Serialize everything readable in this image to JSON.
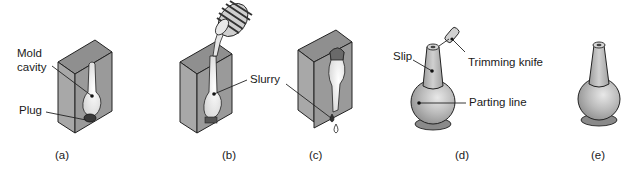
{
  "figure": {
    "colors": {
      "mold_face": "#9a9a9a",
      "mold_side": "#b3b3b3",
      "mold_top": "#8c8c8c",
      "cavity": "#e6e6e6",
      "outline": "#222222",
      "product": "#b8b8b8"
    },
    "panels": [
      {
        "id": "a",
        "caption": "(a)",
        "labels": [
          "Mold cavity",
          "Plug"
        ]
      },
      {
        "id": "b",
        "caption": "(b)",
        "labels": [
          "Slurry"
        ]
      },
      {
        "id": "c",
        "caption": "(c)",
        "labels": []
      },
      {
        "id": "d",
        "caption": "(d)",
        "labels": [
          "Slip",
          "Trimming knife",
          "Parting line"
        ]
      },
      {
        "id": "e",
        "caption": "(e)",
        "labels": []
      }
    ]
  },
  "labels": {
    "mold": "Mold",
    "cavity": "cavity",
    "plug": "Plug",
    "slurry": "Slurry",
    "slip": "Slip",
    "trimming_knife": "Trimming knife",
    "parting_line": "Parting line"
  },
  "captions": {
    "a": "(a)",
    "b": "(b)",
    "c": "(c)",
    "d": "(d)",
    "e": "(e)"
  }
}
